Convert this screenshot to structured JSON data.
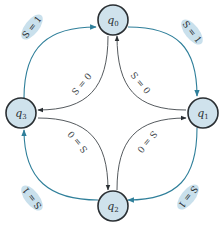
{
  "diagram": {
    "type": "state-machine",
    "colors": {
      "state_fill": "#cfe2ec",
      "state_stroke": "#2a2f33",
      "outer_edge": "#2f7f9a",
      "inner_edge": "#555a5e",
      "label_bg": "#c9e0ec"
    },
    "states": [
      {
        "id": "q0",
        "base": "q",
        "sub": "0",
        "position": "top"
      },
      {
        "id": "q1",
        "base": "q",
        "sub": "1",
        "position": "right"
      },
      {
        "id": "q2",
        "base": "q",
        "sub": "2",
        "position": "bottom"
      },
      {
        "id": "q3",
        "base": "q",
        "sub": "3",
        "position": "left"
      }
    ],
    "transitions": [
      {
        "from": "q3",
        "to": "q0",
        "label": "S = 1",
        "style": "outer"
      },
      {
        "from": "q0",
        "to": "q1",
        "label": "S = 1",
        "style": "outer"
      },
      {
        "from": "q1",
        "to": "q2",
        "label": "S = 1",
        "style": "outer"
      },
      {
        "from": "q2",
        "to": "q3",
        "label": "S = 1",
        "style": "outer"
      },
      {
        "from": "q0",
        "to": "q3",
        "label": "S = 0",
        "style": "inner"
      },
      {
        "from": "q1",
        "to": "q0",
        "label": "S = 0",
        "style": "inner"
      },
      {
        "from": "q2",
        "to": "q1",
        "label": "S = 0",
        "style": "inner"
      },
      {
        "from": "q3",
        "to": "q2",
        "label": "S = 0",
        "style": "inner"
      }
    ]
  }
}
